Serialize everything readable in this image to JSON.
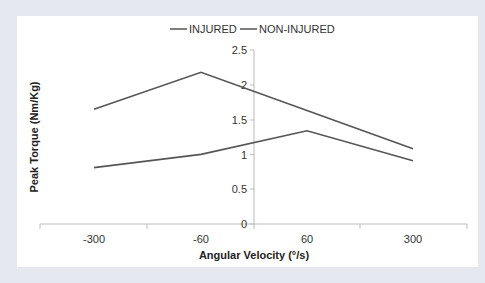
{
  "chart_data": {
    "type": "line",
    "title": "",
    "xlabel": "Angular Velocity (°/s)",
    "ylabel": "Peak Torque (Nm/Kg)",
    "categories": [
      "-300",
      "-60",
      "60",
      "300"
    ],
    "ylim": [
      0,
      2.5
    ],
    "yticks": [
      "0",
      "0.5",
      "1",
      "1.5",
      "2",
      "2.5"
    ],
    "grid": false,
    "legend_position": "top",
    "series": [
      {
        "name": "INJURED",
        "values": [
          0.81,
          1.0,
          1.34,
          0.91
        ],
        "color": "#555555"
      },
      {
        "name": "NON-INJURED",
        "values": [
          1.65,
          2.18,
          1.63,
          1.08
        ],
        "color": "#555555"
      }
    ]
  },
  "legend": {
    "items": [
      "INJURED",
      "NON-INJURED"
    ]
  },
  "axes": {
    "x_title": "Angular Velocity (°/s)",
    "y_title": "Peak Torque (Nm/Kg)",
    "x_labels": [
      "-300",
      "-60",
      "60",
      "300"
    ],
    "y_labels": [
      "0",
      "0.5",
      "1",
      "1.5",
      "2",
      "2.5"
    ]
  }
}
